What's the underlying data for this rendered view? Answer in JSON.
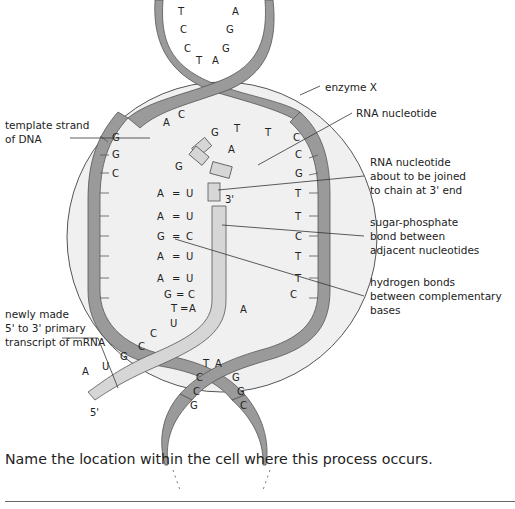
{
  "labels": {
    "template_strand": [
      "template strand",
      "of DNA"
    ],
    "enzyme": "enzyme X",
    "rna_nucleotide": "RNA nucleotide",
    "rna_nucleotide_joining": [
      "RNA nucleotide",
      "about to be joined",
      "to chain at 3' end"
    ],
    "sugar_phosphate": [
      "sugar-phosphate",
      "bond between",
      "adjacent nucleotides"
    ],
    "hydrogen_bonds": [
      "hydrogen bonds",
      "between complementary",
      "bases"
    ],
    "mrna": [
      "newly made",
      "5' to 3' primary",
      "transcript of mRNA"
    ],
    "three_prime": "3'",
    "five_prime": "5'"
  },
  "bases": {
    "top_left": [
      "T",
      "C",
      "C",
      "T"
    ],
    "top_right": [
      "A",
      "G",
      "G",
      "A"
    ],
    "template_free": [
      "A",
      "G",
      "G",
      "C"
    ],
    "template_paired": [
      "A",
      "A",
      "G",
      "A",
      "A",
      "G",
      "T"
    ],
    "rna_paired": [
      "U",
      "U",
      "C",
      "U",
      "U",
      "C",
      "A"
    ],
    "coding_strand": [
      "T",
      "C",
      "C",
      "G",
      "T",
      "T",
      "C",
      "T",
      "T",
      "C",
      "A"
    ],
    "free_nucleotides": [
      "C",
      "G",
      "A"
    ],
    "mrna_tail": [
      "U",
      "C",
      "C",
      "G",
      "U",
      "A"
    ],
    "bottom_left": [
      "T",
      "C",
      "C",
      "G"
    ],
    "bottom_right": [
      "A",
      "G",
      "G",
      "C"
    ]
  },
  "colors": {
    "strand_dark": "#9a9a9a",
    "strand_light": "#d6d6d6",
    "bubble": "#f0f0f0",
    "outline": "#555555"
  },
  "question": {
    "text": "Name the location within the cell where this process occurs.",
    "answer": ""
  }
}
